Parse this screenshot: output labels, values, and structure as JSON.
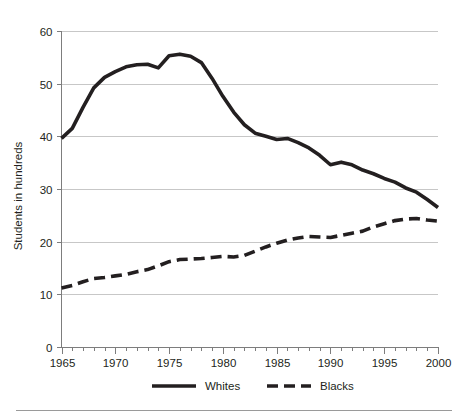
{
  "chart_data": {
    "type": "line",
    "title": "",
    "xlabel": "",
    "ylabel": "Students in hundreds",
    "xlim": [
      1965,
      2000
    ],
    "ylim": [
      0,
      60
    ],
    "yticks": [
      0,
      10,
      20,
      30,
      40,
      50,
      60
    ],
    "xticks": [
      1965,
      1970,
      1975,
      1980,
      1985,
      1990,
      1995,
      2000
    ],
    "x_minor_tick_interval": 1,
    "grid": "horizontal",
    "legend_position": "bottom",
    "x": [
      1965,
      1966,
      1967,
      1968,
      1969,
      1970,
      1971,
      1972,
      1973,
      1974,
      1975,
      1976,
      1977,
      1978,
      1979,
      1980,
      1981,
      1982,
      1983,
      1984,
      1985,
      1986,
      1987,
      1988,
      1989,
      1990,
      1991,
      1992,
      1993,
      1994,
      1995,
      1996,
      1997,
      1998,
      1999,
      2000
    ],
    "series": [
      {
        "name": "Whites",
        "style": "solid",
        "color": "#231f20",
        "values": [
          39.6,
          41.5,
          45.5,
          49.2,
          51.2,
          52.3,
          53.2,
          53.6,
          53.7,
          53.0,
          55.3,
          55.6,
          55.2,
          54.0,
          51.0,
          47.6,
          44.6,
          42.2,
          40.6,
          40.0,
          39.4,
          39.6,
          38.8,
          37.8,
          36.4,
          34.6,
          35.1,
          34.6,
          33.6,
          32.9,
          32.0,
          31.3,
          30.2,
          29.4,
          28.0,
          26.5
        ]
      },
      {
        "name": "Blacks",
        "style": "dashed",
        "color": "#231f20",
        "values": [
          11.2,
          11.7,
          12.4,
          13.0,
          13.2,
          13.5,
          13.8,
          14.3,
          14.7,
          15.4,
          16.2,
          16.6,
          16.7,
          16.8,
          17.0,
          17.2,
          17.1,
          17.4,
          18.2,
          19.0,
          19.7,
          20.3,
          20.7,
          21.0,
          20.9,
          20.8,
          21.2,
          21.6,
          22.0,
          22.8,
          23.4,
          24.0,
          24.3,
          24.4,
          24.1,
          23.9
        ]
      }
    ],
    "legend": [
      {
        "label": "Whites",
        "style": "solid"
      },
      {
        "label": "Blacks",
        "style": "dashed"
      }
    ]
  },
  "axis": {
    "y_title": "Students in hundreds",
    "y_tick_labels": [
      "0",
      "10",
      "20",
      "30",
      "40",
      "50",
      "60"
    ],
    "x_tick_labels": [
      "1965",
      "1970",
      "1975",
      "1980",
      "1985",
      "1990",
      "1995",
      "2000"
    ]
  },
  "legend": {
    "whites_label": "Whites",
    "blacks_label": "Blacks"
  },
  "colors": {
    "line": "#231f20",
    "gridline": "#b9b9b9",
    "axis": "#7d7d7d",
    "background": "#ffffff"
  }
}
